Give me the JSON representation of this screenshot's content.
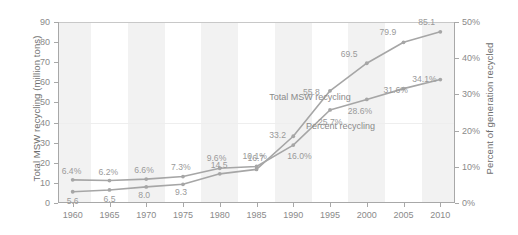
{
  "chart_data": {
    "type": "line",
    "title": "",
    "xlabel": "",
    "x": [
      1960,
      1965,
      1970,
      1975,
      1980,
      1985,
      1990,
      1995,
      2000,
      2005,
      2010
    ],
    "xticklabels": [
      "1960",
      "1965",
      "1970",
      "1975",
      "1980",
      "1985",
      "1990",
      "1995",
      "2000",
      "2005",
      "2010"
    ],
    "xlim": [
      1958,
      2012
    ],
    "grid": false,
    "legend_position": "inline-annotation",
    "axes": [
      {
        "side": "left",
        "ylabel": "Total MSW recycling (million tons)",
        "ylim": [
          0,
          90
        ],
        "yticks": [
          0,
          10,
          20,
          30,
          40,
          50,
          60,
          70,
          80,
          90
        ],
        "yticklabels": [
          "0",
          "10",
          "20",
          "30",
          "40",
          "50",
          "60",
          "70",
          "80",
          "90"
        ]
      },
      {
        "side": "right",
        "ylabel": "Percent of generation recycled",
        "ylim": [
          0,
          50
        ],
        "yticks": [
          0,
          10,
          20,
          30,
          40,
          50
        ],
        "yticklabels": [
          "0%",
          "10%",
          "20%",
          "30%",
          "40%",
          "50%"
        ]
      }
    ],
    "series": [
      {
        "name": "Total MSW recycling",
        "axis": "left",
        "units": "million tons",
        "color": "#a6a6a6",
        "values": [
          5.6,
          6.5,
          8.0,
          9.3,
          14.5,
          16.7,
          33.2,
          55.8,
          69.5,
          79.9,
          85.1
        ],
        "labels": [
          "5.6",
          "6.5",
          "8.0",
          "9.3",
          "14.5",
          "16.7",
          "33.2",
          "55.8",
          "69.5",
          "79.9",
          "85.1"
        ]
      },
      {
        "name": "Percent recycling",
        "axis": "right",
        "units": "percent",
        "color": "#a6a6a6",
        "values": [
          6.4,
          6.2,
          6.6,
          7.3,
          9.6,
          10.1,
          16.0,
          25.7,
          28.6,
          31.6,
          34.1
        ],
        "labels": [
          "6.4%",
          "6.2%",
          "6.6%",
          "7.3%",
          "9.6%",
          "10.1%",
          "16.0%",
          "25.7%",
          "28.6%",
          "31.6%",
          "34.1%"
        ]
      }
    ],
    "annotations": [
      {
        "text": "Total MSW recycling",
        "x": 1993,
        "y": 52
      },
      {
        "text": "Percent recycling",
        "x": 1998,
        "y": 38
      }
    ]
  }
}
